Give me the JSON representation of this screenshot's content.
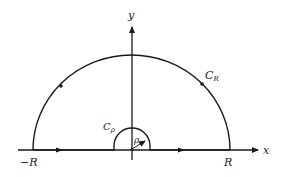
{
  "diagram": {
    "colors": {
      "stroke": "#1a1a1a",
      "background": "#ffffff"
    },
    "axes": {
      "x_label": "x",
      "y_label": "y"
    },
    "labels": {
      "neg_R": "−R",
      "pos_R": "R",
      "big_arc": "C",
      "big_arc_sub": "R",
      "small_arc": "C",
      "small_arc_sub": "ρ",
      "radius": "ρ"
    },
    "contour": {
      "segments": [
        {
          "name": "left-segment",
          "from": "-R",
          "to": "-ρ",
          "direction": "rightward"
        },
        {
          "name": "small-arc",
          "label": "Cρ",
          "radius": "ρ",
          "direction": "clockwise"
        },
        {
          "name": "right-segment",
          "from": "ρ",
          "to": "R",
          "direction": "rightward"
        },
        {
          "name": "big-arc",
          "label": "CR",
          "radius": "R",
          "direction": "counterclockwise"
        }
      ]
    }
  }
}
